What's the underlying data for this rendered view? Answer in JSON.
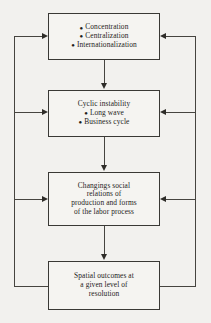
{
  "diagram": {
    "type": "flowchart",
    "orientation": "vertical-with-feedback-loops",
    "colors": {
      "background": "#f2f1ee",
      "box_fill": "#f5f4f1",
      "box_border": "#3a3935",
      "connector": "#46443f",
      "text": "#1d1c1a"
    },
    "nodes": [
      {
        "id": "node-1",
        "heading": "",
        "bullets": [
          "Concentration",
          "Centralization",
          "Internationalization"
        ],
        "lines": []
      },
      {
        "id": "node-2",
        "heading": "Cyclic instability",
        "bullets": [
          "Long wave",
          "Business cycle"
        ],
        "lines": []
      },
      {
        "id": "node-3",
        "heading": "",
        "bullets": [],
        "lines": [
          "Changings social",
          "relations of",
          "production and forms",
          "of the labor process"
        ]
      },
      {
        "id": "node-4",
        "heading": "",
        "bullets": [],
        "lines": [
          "Spatial outcomes at",
          "a given level of",
          "resolution"
        ]
      }
    ],
    "bullet_glyph": "●",
    "connectors": {
      "forward_label": "downward-flow",
      "feedback_left_label": "left-feedback-loop",
      "feedback_right_label": "right-feedback-loop"
    }
  }
}
